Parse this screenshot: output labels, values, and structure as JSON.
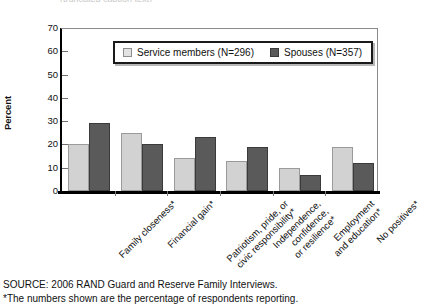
{
  "clipped_header": "(truncated caption text)",
  "chart_data": {
    "type": "bar",
    "title": "",
    "xlabel": "",
    "ylabel": "Percent",
    "ylim": [
      0,
      70
    ],
    "yticks": [
      70,
      60,
      50,
      40,
      30,
      20,
      10,
      0
    ],
    "grid": false,
    "legend_position": "top-center",
    "categories": [
      "Family closeness*",
      "Financial gain*",
      "Patriotism, pride, or civic responsibility*",
      "Independence, confidence, or resilience*",
      "Employment and education*",
      "No positives*"
    ],
    "category_lines": [
      [
        "Family closeness*"
      ],
      [
        "Financial gain*"
      ],
      [
        "Patriotism, pride, or",
        "civic responsibility*"
      ],
      [
        "Independence,",
        "confidence,",
        "or resilience*"
      ],
      [
        "Employment",
        "and education*"
      ],
      [
        "No positives*"
      ]
    ],
    "series": [
      {
        "name": "Service members (N=296)",
        "color": "#d2d2d2",
        "values": [
          20,
          25,
          14,
          13,
          10,
          19
        ]
      },
      {
        "name": "Spouses (N=357)",
        "color": "#5a5a5a",
        "values": [
          29,
          20,
          23,
          19,
          7,
          12
        ]
      }
    ]
  },
  "footer": {
    "source": "SOURCE: 2006 RAND Guard and Reserve Family Interviews.",
    "note": "*The numbers shown are the percentage of respondents reporting."
  }
}
